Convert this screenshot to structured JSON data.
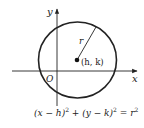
{
  "diagram": {
    "type": "circle-on-axes",
    "axes": {
      "x_label": "x",
      "y_label": "y",
      "origin_label": "O"
    },
    "circle": {
      "center_label": "(h, k)",
      "radius_label": "r"
    },
    "equation": {
      "left1": "(x − h)",
      "exp1": "2",
      "plus": " + ",
      "left2": "(y − k)",
      "exp2": "2",
      "equals": " = ",
      "right": "r",
      "exp3": "2"
    },
    "colors": {
      "stroke": "#222222",
      "background": "#ffffff"
    }
  }
}
